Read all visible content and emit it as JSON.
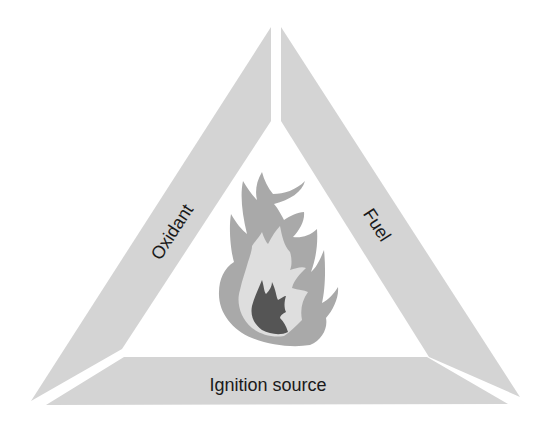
{
  "diagram": {
    "type": "fire-triangle",
    "sides": {
      "left": {
        "label": "Oxidant"
      },
      "right": {
        "label": "Fuel"
      },
      "bottom": {
        "label": "Ignition source"
      }
    },
    "center_icon": "flame-icon",
    "colors": {
      "background": "#ffffff",
      "side_fill": "#d4d4d4",
      "flame_outer": "#a9a9a9",
      "flame_middle": "#dedede",
      "flame_core": "#555555",
      "text": "#1a1a1a"
    }
  }
}
